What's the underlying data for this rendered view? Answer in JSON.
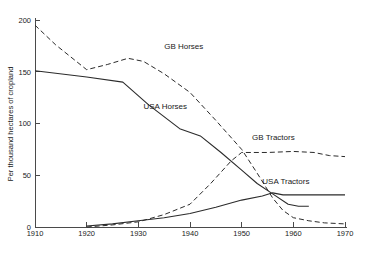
{
  "chart_data": {
    "type": "line",
    "title": "",
    "xlabel": "",
    "ylabel": "Per thousand hectares of cropland",
    "xlim": [
      1910,
      1970
    ],
    "ylim": [
      0,
      200
    ],
    "grid": false,
    "legend_position": "inline-labels",
    "xticks": [
      1910,
      1920,
      1930,
      1940,
      1950,
      1960,
      1970
    ],
    "xtick_labels": [
      "1910",
      "1920",
      "1930",
      "1940",
      "1950",
      "1960",
      "1970"
    ],
    "yticks": [
      0,
      50,
      100,
      150,
      200
    ],
    "ytick_labels": [
      "0",
      "50",
      "100",
      "150",
      "200"
    ],
    "series": [
      {
        "name": "GB Horses",
        "style": "dashed",
        "label_x": 1935,
        "label_y": 172,
        "points": [
          [
            1910,
            195
          ],
          [
            1914,
            176
          ],
          [
            1920,
            152
          ],
          [
            1924,
            157
          ],
          [
            1928,
            163
          ],
          [
            1931,
            160
          ],
          [
            1935,
            148
          ],
          [
            1940,
            130
          ],
          [
            1945,
            103
          ],
          [
            1950,
            75
          ],
          [
            1953,
            52
          ],
          [
            1956,
            28
          ],
          [
            1958,
            16
          ],
          [
            1960,
            9
          ],
          [
            1963,
            6
          ],
          [
            1966,
            4
          ],
          [
            1970,
            3
          ]
        ]
      },
      {
        "name": "USA Horses",
        "style": "solid",
        "label_x": 1931,
        "label_y": 114,
        "points": [
          [
            1910,
            151
          ],
          [
            1920,
            145
          ],
          [
            1927,
            140
          ],
          [
            1932,
            118
          ],
          [
            1938,
            95
          ],
          [
            1942,
            88
          ],
          [
            1946,
            72
          ],
          [
            1950,
            55
          ],
          [
            1953,
            42
          ],
          [
            1956,
            32
          ],
          [
            1959,
            22
          ],
          [
            1961,
            20
          ],
          [
            1963,
            20
          ]
        ]
      },
      {
        "name": "GB Tractors",
        "style": "dashed",
        "label_x": 1952,
        "label_y": 84,
        "points": [
          [
            1920,
            0
          ],
          [
            1925,
            2
          ],
          [
            1930,
            5
          ],
          [
            1935,
            12
          ],
          [
            1940,
            22
          ],
          [
            1944,
            42
          ],
          [
            1948,
            64
          ],
          [
            1950,
            72
          ],
          [
            1955,
            72
          ],
          [
            1960,
            73
          ],
          [
            1964,
            72
          ],
          [
            1967,
            69
          ],
          [
            1970,
            68
          ]
        ]
      },
      {
        "name": "USA Tractors",
        "style": "solid",
        "label_x": 1954,
        "label_y": 42,
        "points": [
          [
            1920,
            1
          ],
          [
            1925,
            3
          ],
          [
            1930,
            6
          ],
          [
            1935,
            9
          ],
          [
            1940,
            13
          ],
          [
            1945,
            19
          ],
          [
            1950,
            26
          ],
          [
            1954,
            30
          ],
          [
            1956,
            33
          ],
          [
            1958,
            31
          ],
          [
            1962,
            31
          ],
          [
            1966,
            31
          ],
          [
            1970,
            31
          ]
        ]
      }
    ]
  },
  "axes": {
    "y_title": "Per thousand hectares of cropland"
  }
}
